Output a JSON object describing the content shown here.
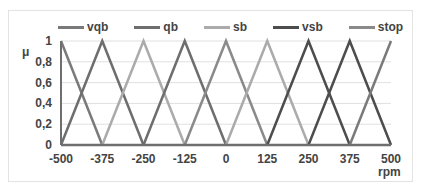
{
  "chart_data": {
    "type": "line",
    "title": "",
    "xlabel": "rpm",
    "ylabel": "μ",
    "xlim": [
      -500,
      500
    ],
    "ylim": [
      0,
      1
    ],
    "x_ticks": [
      "-500",
      "-375",
      "-250",
      "-125",
      "0",
      "125",
      "250",
      "375",
      "500"
    ],
    "y_ticks": [
      "0",
      "0,2",
      "0,4",
      "0,6",
      "0,8",
      "1"
    ],
    "grid": "horizontal",
    "legend_position": "top",
    "legend": [
      "vqb",
      "qb",
      "sb",
      "vsb",
      "stop"
    ],
    "series": [
      {
        "name": "vqb",
        "color": "#7a7a7a",
        "points": [
          [
            -500,
            1
          ],
          [
            -375,
            0
          ]
        ]
      },
      {
        "name": "qb",
        "color": "#6e6e6e",
        "points": [
          [
            -500,
            0
          ],
          [
            -375,
            1
          ],
          [
            -250,
            0
          ]
        ]
      },
      {
        "name": "sb",
        "color": "#ababab",
        "points": [
          [
            -375,
            0
          ],
          [
            -250,
            1
          ],
          [
            -125,
            0
          ]
        ]
      },
      {
        "name": "qb",
        "color": "#6e6e6e",
        "points": [
          [
            -250,
            0
          ],
          [
            -125,
            1
          ],
          [
            0,
            0
          ]
        ]
      },
      {
        "name": "stop",
        "color": "#8a8a8a",
        "points": [
          [
            -125,
            0
          ],
          [
            0,
            1
          ],
          [
            125,
            0
          ]
        ]
      },
      {
        "name": "sb",
        "color": "#ababab",
        "points": [
          [
            0,
            0
          ],
          [
            125,
            1
          ],
          [
            250,
            0
          ]
        ]
      },
      {
        "name": "vsb",
        "color": "#4d4d4d",
        "points": [
          [
            125,
            0
          ],
          [
            250,
            1
          ],
          [
            375,
            0
          ]
        ]
      },
      {
        "name": "vsb",
        "color": "#4d4d4d",
        "points": [
          [
            250,
            0
          ],
          [
            375,
            1
          ],
          [
            500,
            0
          ]
        ]
      },
      {
        "name": "vqb",
        "color": "#7a7a7a",
        "points": [
          [
            375,
            0
          ],
          [
            500,
            1
          ]
        ]
      }
    ]
  },
  "legend_items": [
    {
      "label": "vqb",
      "color": "#7a7a7a"
    },
    {
      "label": "qb",
      "color": "#6e6e6e"
    },
    {
      "label": "sb",
      "color": "#ababab"
    },
    {
      "label": "vsb",
      "color": "#4d4d4d"
    },
    {
      "label": "stop",
      "color": "#8a8a8a"
    }
  ],
  "axis": {
    "y_label": "μ",
    "x_label": "rpm"
  }
}
